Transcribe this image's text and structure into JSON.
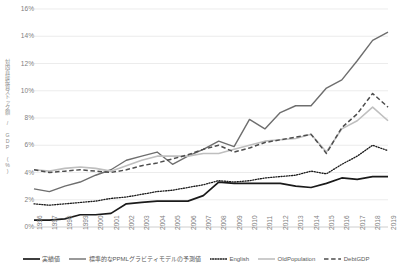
{
  "chart_data": {
    "type": "line",
    "title": "",
    "xlabel": "",
    "ylabel": "対内直接投資ストック額 / GDP (%)",
    "ylim": [
      0,
      16
    ],
    "yticks": [
      0,
      2,
      4,
      6,
      8,
      10,
      12,
      14,
      16
    ],
    "ytick_labels": [
      "0%",
      "2%",
      "4%",
      "6%",
      "8%",
      "10%",
      "12%",
      "14%",
      "16%"
    ],
    "grid": true,
    "legend_position": "bottom",
    "categories": [
      "1996",
      "1997",
      "1998",
      "1999",
      "2000",
      "2001",
      "2002",
      "2003",
      "2004",
      "2005",
      "2006",
      "2007",
      "2008",
      "2009",
      "2010",
      "2011",
      "2012",
      "2013",
      "2014",
      "2015",
      "2016",
      "2017",
      "2018",
      "2019"
    ],
    "series": [
      {
        "name": "実績値",
        "style": "solid",
        "color": "#1a1a1a",
        "width": 1.7,
        "values": [
          0.5,
          0.5,
          0.6,
          0.9,
          0.9,
          1.0,
          1.7,
          1.8,
          1.9,
          1.9,
          1.9,
          2.3,
          3.3,
          3.2,
          3.2,
          3.2,
          3.2,
          3.0,
          2.9,
          3.2,
          3.6,
          3.5,
          3.7,
          3.7
        ]
      },
      {
        "name": "標準的なPPMLグラビティモデルの予測値",
        "style": "solid",
        "color": "#6e6e6e",
        "width": 1.4,
        "values": [
          2.8,
          2.6,
          3.0,
          3.3,
          3.8,
          4.2,
          4.9,
          5.2,
          5.5,
          4.6,
          5.2,
          5.7,
          6.3,
          5.9,
          7.9,
          7.2,
          8.4,
          8.9,
          8.9,
          10.2,
          10.8,
          12.2,
          13.7,
          14.3
        ]
      },
      {
        "name": "English",
        "style": "dotted",
        "color": "#1a1a1a",
        "width": 1.3,
        "values": [
          1.7,
          1.6,
          1.7,
          1.8,
          1.9,
          2.1,
          2.2,
          2.4,
          2.6,
          2.7,
          2.9,
          3.1,
          3.4,
          3.3,
          3.4,
          3.6,
          3.7,
          3.8,
          4.1,
          3.9,
          4.6,
          5.2,
          6.0,
          5.6
        ]
      },
      {
        "name": "OldPopulation",
        "style": "solid",
        "color": "#bfbfbf",
        "width": 1.6,
        "values": [
          4.2,
          4.1,
          4.3,
          4.4,
          4.3,
          4.1,
          4.5,
          4.9,
          5.2,
          5.2,
          5.2,
          5.4,
          5.4,
          5.7,
          6.0,
          6.3,
          6.4,
          6.5,
          6.8,
          5.5,
          7.2,
          7.8,
          8.8,
          7.8
        ]
      },
      {
        "name": "DebtGDP",
        "style": "dashed",
        "color": "#4d4d4d",
        "width": 1.5,
        "values": [
          4.2,
          4.0,
          4.1,
          4.2,
          4.1,
          4.0,
          4.2,
          4.5,
          4.7,
          5.0,
          5.3,
          5.7,
          6.0,
          5.5,
          5.8,
          6.2,
          6.4,
          6.6,
          6.8,
          5.4,
          7.3,
          8.3,
          9.8,
          8.8
        ]
      }
    ]
  }
}
